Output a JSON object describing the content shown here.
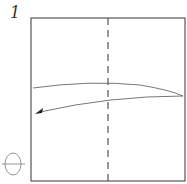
{
  "diagram": {
    "step_number": "1",
    "type": "origami-fold-step",
    "elements": {
      "paper": {
        "shape": "square",
        "x": 31,
        "y": 18,
        "width": 154,
        "height": 163,
        "stroke": "#555555"
      },
      "valley_fold_line": {
        "style": "dashed",
        "x": 108,
        "y1": 18,
        "y2": 181,
        "stroke": "#555555"
      },
      "fold_arrow": {
        "direction": "right-to-left",
        "stroke": "#666666"
      },
      "turn_over_symbol": {
        "shape": "circle-with-line",
        "cx": 13,
        "cy": 164,
        "stroke": "#888888"
      }
    }
  }
}
